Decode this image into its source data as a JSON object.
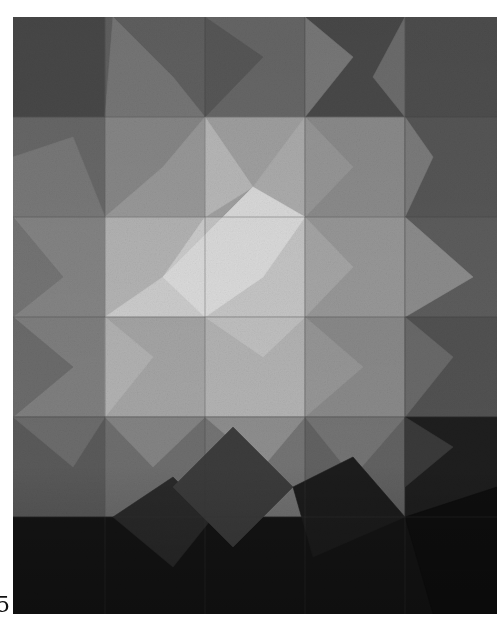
{
  "image": {
    "subject": "geometric grayscale patchwork quilt",
    "alt": "Photograph of a quilt made of triangular and square patches in shades of gray, brightest in the center and darkening toward the edges"
  },
  "page": {
    "number_fragment": "5"
  },
  "palette": {
    "background": "#ffffff",
    "lightest": "#dcdcdc",
    "light": "#c4c4c4",
    "mid_light": "#a8a8a8",
    "mid": "#8c8c8c",
    "mid_dark": "#6e6e6e",
    "dark": "#4e4e4e",
    "darker": "#353535",
    "darkest": "#111111"
  },
  "quilt": {
    "patches": [
      {
        "points": "0,0 92,0 92,100 0,100",
        "fill": "#4a4a4a"
      },
      {
        "points": "92,0 192,0 92,100",
        "fill": "#5c5c5c"
      },
      {
        "points": "92,0 192,0 192,100 92,100",
        "fill": "#636363"
      },
      {
        "points": "192,0 292,0 292,100 192,100",
        "fill": "#6a6a6a"
      },
      {
        "points": "292,0 392,0 392,100 292,100",
        "fill": "#4b4b4b"
      },
      {
        "points": "392,0 484,0 484,100 392,100",
        "fill": "#505050"
      },
      {
        "points": "100,0 160,60 192,100 92,100",
        "fill": "#7a7a7a"
      },
      {
        "points": "192,0 250,40 192,100",
        "fill": "#5a5a5a"
      },
      {
        "points": "292,0 340,40 292,100",
        "fill": "#7c7c7c"
      },
      {
        "points": "392,0 392,100 360,60",
        "fill": "#707070"
      },
      {
        "points": "0,100 92,100 92,200 0,200",
        "fill": "#6a6a6a"
      },
      {
        "points": "0,140 60,120 92,200 0,200",
        "fill": "#7b7b7b"
      },
      {
        "points": "92,100 192,100 192,200 92,200",
        "fill": "#8a8a8a"
      },
      {
        "points": "92,200 150,150 192,100 192,200",
        "fill": "#9c9c9c"
      },
      {
        "points": "192,100 292,100 292,200 192,200",
        "fill": "#a4a4a4"
      },
      {
        "points": "192,100 240,170 192,200",
        "fill": "#bcbcbc"
      },
      {
        "points": "240,170 292,100 292,200",
        "fill": "#b0b0b0"
      },
      {
        "points": "292,100 392,100 392,200 292,200",
        "fill": "#8e8e8e"
      },
      {
        "points": "292,100 340,150 292,200",
        "fill": "#9a9a9a"
      },
      {
        "points": "392,100 484,100 484,200 392,200",
        "fill": "#585858"
      },
      {
        "points": "392,100 420,140 392,200",
        "fill": "#7e7e7e"
      },
      {
        "points": "0,200 92,200 92,300 0,300",
        "fill": "#868686"
      },
      {
        "points": "0,200 50,260 0,300",
        "fill": "#767676"
      },
      {
        "points": "92,200 192,200 192,300 92,300",
        "fill": "#b6b6b6"
      },
      {
        "points": "92,300 150,260 192,200 192,300",
        "fill": "#cfcfcf"
      },
      {
        "points": "192,200 292,200 292,300 192,300",
        "fill": "#c8c8c8"
      },
      {
        "points": "150,260 240,170 292,200 250,260 192,300",
        "fill": "#dedede"
      },
      {
        "points": "292,200 392,200 392,300 292,300",
        "fill": "#9a9a9a"
      },
      {
        "points": "292,200 340,250 292,300",
        "fill": "#a8a8a8"
      },
      {
        "points": "392,200 484,200 484,300 392,300",
        "fill": "#5e5e5e"
      },
      {
        "points": "392,200 460,260 392,300",
        "fill": "#8e8e8e"
      },
      {
        "points": "0,300 92,300 92,400 0,400",
        "fill": "#808080"
      },
      {
        "points": "0,300 60,350 0,400",
        "fill": "#6c6c6c"
      },
      {
        "points": "92,300 192,300 192,400 92,400",
        "fill": "#a6a6a6"
      },
      {
        "points": "92,300 140,340 92,400",
        "fill": "#b3b3b3"
      },
      {
        "points": "192,300 292,300 292,400 192,400",
        "fill": "#b4b4b4"
      },
      {
        "points": "192,300 250,340 292,300",
        "fill": "#c2c2c2"
      },
      {
        "points": "292,300 392,300 392,400 292,400",
        "fill": "#8a8a8a"
      },
      {
        "points": "292,300 350,350 292,400",
        "fill": "#979797"
      },
      {
        "points": "392,300 484,300 484,400 392,400",
        "fill": "#525252"
      },
      {
        "points": "392,300 440,340 392,400",
        "fill": "#6a6a6a"
      },
      {
        "points": "0,400 92,400 92,500 0,500",
        "fill": "#5a5a5a"
      },
      {
        "points": "0,400 60,450 92,400",
        "fill": "#6c6c6c"
      },
      {
        "points": "92,400 192,400 192,500 92,500",
        "fill": "#6e6e6e"
      },
      {
        "points": "92,400 140,450 192,400",
        "fill": "#848484"
      },
      {
        "points": "192,400 292,400 292,500 192,500",
        "fill": "#747474"
      },
      {
        "points": "192,400 250,450 292,400",
        "fill": "#8e8e8e"
      },
      {
        "points": "292,400 392,400 392,500 292,500",
        "fill": "#626262"
      },
      {
        "points": "292,400 340,460 392,400",
        "fill": "#747474"
      },
      {
        "points": "392,400 484,400 484,500 392,500",
        "fill": "#1e1e1e"
      },
      {
        "points": "392,400 440,430 392,470",
        "fill": "#3a3a3a"
      },
      {
        "points": "0,500 484,500 484,597 0,597",
        "fill": "#141414"
      },
      {
        "points": "100,500 160,460 200,500 160,550",
        "fill": "#2a2a2a"
      },
      {
        "points": "160,470 220,410 280,470 220,530",
        "fill": "#3c3c3c"
      },
      {
        "points": "280,470 340,440 392,500 300,540",
        "fill": "#1c1c1c"
      },
      {
        "points": "392,500 484,470 484,597 420,597",
        "fill": "#0e0e0e"
      }
    ],
    "grid_lines_x": [
      92,
      192,
      292,
      392
    ],
    "grid_lines_y": [
      100,
      200,
      300,
      400,
      500
    ],
    "grid_color": "#3a3a3a"
  }
}
